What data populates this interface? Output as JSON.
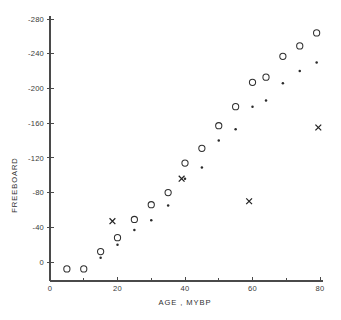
{
  "chart_data": {
    "type": "scatter",
    "title": "",
    "xlabel": "AGE , MYBP",
    "ylabel": "FREEBOARD",
    "xlim": [
      0,
      80
    ],
    "ylim": [
      0,
      -280
    ],
    "grid": false,
    "legend": "none",
    "x_ticks_major": [
      0,
      20,
      40,
      60,
      80
    ],
    "x_ticks_minor": [
      10,
      30,
      50,
      70
    ],
    "x_tick_labels": [
      "0",
      "20",
      "40",
      "60",
      "80"
    ],
    "y_ticks_major": [
      0,
      -40,
      -80,
      -120,
      -160,
      -200,
      -240,
      -280
    ],
    "y_tick_labels": [
      "0",
      "-40",
      "-80",
      "-120",
      "-160",
      "-200",
      "-240",
      "-280"
    ],
    "series": [
      {
        "name": "open-circle",
        "marker": "circle",
        "points": [
          {
            "x": 5,
            "y": 8
          },
          {
            "x": 10,
            "y": 8
          },
          {
            "x": 15,
            "y": -12
          },
          {
            "x": 20,
            "y": -28
          },
          {
            "x": 25,
            "y": -49
          },
          {
            "x": 30,
            "y": -66
          },
          {
            "x": 35,
            "y": -80
          },
          {
            "x": 40,
            "y": -114
          },
          {
            "x": 45,
            "y": -131
          },
          {
            "x": 50,
            "y": -157
          },
          {
            "x": 55,
            "y": -179
          },
          {
            "x": 60,
            "y": -207
          },
          {
            "x": 64,
            "y": -213
          },
          {
            "x": 69,
            "y": -237
          },
          {
            "x": 74,
            "y": -249
          },
          {
            "x": 79,
            "y": -264
          }
        ]
      },
      {
        "name": "small-dot",
        "marker": "dot",
        "points": [
          {
            "x": 15,
            "y": -5
          },
          {
            "x": 20,
            "y": -20
          },
          {
            "x": 25,
            "y": -37
          },
          {
            "x": 30,
            "y": -48
          },
          {
            "x": 35,
            "y": -65
          },
          {
            "x": 40,
            "y": -96
          },
          {
            "x": 45,
            "y": -109
          },
          {
            "x": 50,
            "y": -140
          },
          {
            "x": 55,
            "y": -153
          },
          {
            "x": 60,
            "y": -179
          },
          {
            "x": 64,
            "y": -186
          },
          {
            "x": 69,
            "y": -206
          },
          {
            "x": 74,
            "y": -220
          },
          {
            "x": 79,
            "y": -230
          }
        ]
      },
      {
        "name": "cross",
        "marker": "cross",
        "points": [
          {
            "x": 18.5,
            "y": -47
          },
          {
            "x": 39,
            "y": -96
          },
          {
            "x": 59,
            "y": -70
          },
          {
            "x": 79.5,
            "y": -155
          }
        ]
      }
    ]
  },
  "figure": {
    "caption": ""
  }
}
